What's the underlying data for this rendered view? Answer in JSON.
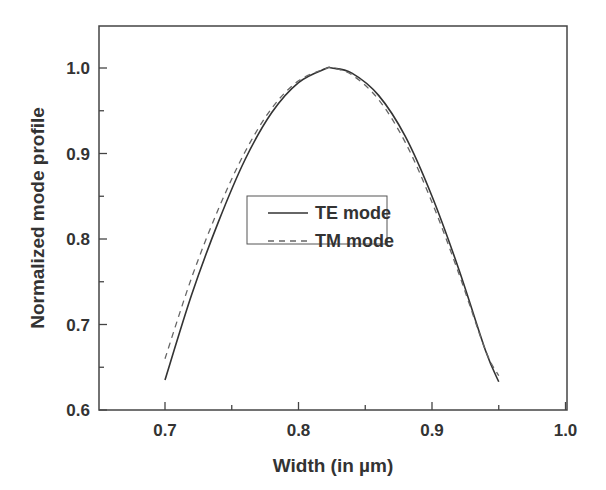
{
  "chart_data": {
    "type": "line",
    "title": "",
    "xlabel": "Width (in µm)",
    "ylabel": "Normalized mode profile",
    "xlim": [
      0.65,
      1.0
    ],
    "ylim": [
      0.6,
      1.05
    ],
    "x_ticks": [
      0.7,
      0.8,
      0.9,
      1.0
    ],
    "x_tick_labels": [
      "0.7",
      "0.8",
      "0.9",
      "1.0"
    ],
    "x_minor_ticks": [
      0.75,
      0.85,
      0.95
    ],
    "y_ticks": [
      0.6,
      0.7,
      0.8,
      0.9,
      1.0
    ],
    "y_tick_labels": [
      "0.6",
      "0.7",
      "0.8",
      "0.9",
      "1.0"
    ],
    "y_minor_ticks": [
      0.65,
      0.75,
      0.85,
      0.95
    ],
    "grid": false,
    "legend_position": "center",
    "series": [
      {
        "name": "TE mode",
        "style": "solid",
        "color": "#333333",
        "x": [
          0.7,
          0.72,
          0.74,
          0.76,
          0.78,
          0.8,
          0.82,
          0.825,
          0.84,
          0.86,
          0.88,
          0.9,
          0.92,
          0.94,
          0.95
        ],
        "values": [
          0.635,
          0.735,
          0.82,
          0.893,
          0.948,
          0.983,
          0.999,
          1.0,
          0.994,
          0.968,
          0.92,
          0.85,
          0.765,
          0.67,
          0.633
        ]
      },
      {
        "name": "TM mode",
        "style": "dashed",
        "color": "#666666",
        "x": [
          0.7,
          0.72,
          0.74,
          0.76,
          0.78,
          0.8,
          0.82,
          0.825,
          0.84,
          0.86,
          0.88,
          0.9,
          0.92,
          0.94,
          0.95
        ],
        "values": [
          0.66,
          0.755,
          0.835,
          0.902,
          0.953,
          0.985,
          0.999,
          1.0,
          0.992,
          0.963,
          0.913,
          0.843,
          0.76,
          0.67,
          0.64
        ]
      }
    ]
  },
  "labels": {
    "xlabel": "Width (in µm)",
    "ylabel": "Normalized mode profile",
    "legend": [
      "TE mode",
      "TM mode"
    ]
  }
}
